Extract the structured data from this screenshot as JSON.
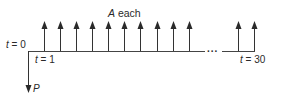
{
  "diagram": {
    "type": "cash-flow-timeline",
    "title_label": {
      "var": "A",
      "text": " each"
    },
    "start_label": {
      "var": "t",
      "text": " = 0"
    },
    "first_label": {
      "var": "t",
      "text": " = 1"
    },
    "end_label": {
      "var": "t",
      "text": " = 30"
    },
    "present_value_label": "P",
    "ellipsis": "...",
    "upward_arrows_x": [
      44,
      60,
      76,
      92,
      108,
      124,
      140,
      157,
      173,
      189,
      238,
      254
    ],
    "periods": 30,
    "colors": {
      "line": "#333333",
      "arrow": "#2a2a2a"
    }
  }
}
